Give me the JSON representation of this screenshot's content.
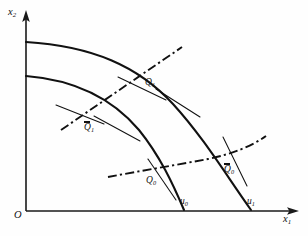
{
  "figure": {
    "kind": "economics-diagram",
    "axes": {
      "x_label": "x",
      "x_label_sub": "1",
      "y_label": "x",
      "y_label_sub": "2",
      "origin_label": "O",
      "x_axis_name": "horizontal-axis",
      "y_axis_name": "vertical-axis",
      "arrow_icon": "arrow-head-icon"
    },
    "points": [
      {
        "id": "Q1",
        "base": "Q",
        "sub": "1",
        "overbar": false,
        "x": 145,
        "y": 82,
        "name": "point-label-q1"
      },
      {
        "id": "Q1b",
        "base": "Q",
        "sub": "1",
        "overbar": true,
        "x": 86,
        "y": 127,
        "name": "point-label-q1-bar"
      },
      {
        "id": "Q0",
        "base": "Q",
        "sub": "0",
        "overbar": false,
        "x": 148,
        "y": 180,
        "name": "point-label-q0"
      },
      {
        "id": "Q0b",
        "base": "Q",
        "sub": "0",
        "overbar": true,
        "x": 226,
        "y": 169,
        "name": "point-label-q0-bar"
      }
    ],
    "intercepts": [
      {
        "id": "u0",
        "base": "u",
        "sub": "0",
        "x": 181,
        "y": 200,
        "name": "x-intercept-label-u0"
      },
      {
        "id": "u1",
        "base": "u",
        "sub": "1",
        "x": 248,
        "y": 200,
        "name": "x-intercept-label-u1"
      }
    ],
    "colors": {
      "ink": "#111111",
      "paper": "#fefefe"
    },
    "curves": {
      "outer_transformation": "outer-transformation-curve",
      "inner_transformation": "inner-transformation-curve",
      "expansion_ray": "expansion-path-ray",
      "expansion_curve": "expansion-path-curve"
    }
  }
}
